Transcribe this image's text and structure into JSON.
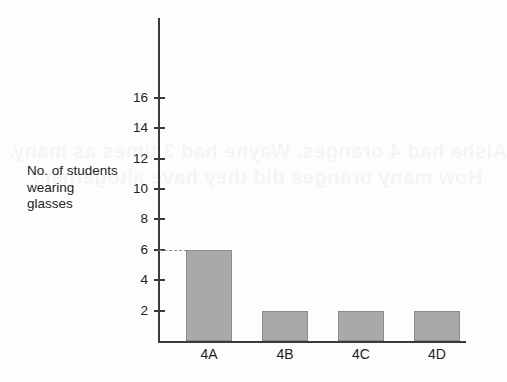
{
  "chart_data": {
    "type": "bar",
    "title": "",
    "subtitle": "",
    "xlabel": "",
    "ylabel": "No. of students wearing glasses",
    "ylabel_lines": [
      "No. of students",
      "wearing",
      "glasses"
    ],
    "categories": [
      "4A",
      "4B",
      "4C",
      "4D"
    ],
    "values": [
      6,
      2,
      2,
      2
    ],
    "ylim": [
      0,
      17
    ],
    "y_ticks": [
      2,
      4,
      6,
      8,
      10,
      12,
      14,
      16
    ],
    "y_tick_labels": [
      "2",
      "4",
      "6",
      "8",
      "10",
      "12",
      "14",
      "16"
    ],
    "grid": false,
    "legend": null,
    "annotations": [
      {
        "name": "dashed-guide-at-6",
        "type": "dashed-horizontal-line",
        "value": 6,
        "from_category": "axis",
        "to_category": "4A"
      }
    ],
    "bar_color": "#a9a9a9",
    "bar_border_color": "#8a8a8a",
    "axis_color": "#3a3a3a",
    "text_color": "#231f20",
    "background_color": "#fdfdfd"
  },
  "ghost_text": {
    "line1": "Aisha had 4 oranges. Wayne had 3 times as many.",
    "line2": "How many oranges did they have altogether?"
  }
}
